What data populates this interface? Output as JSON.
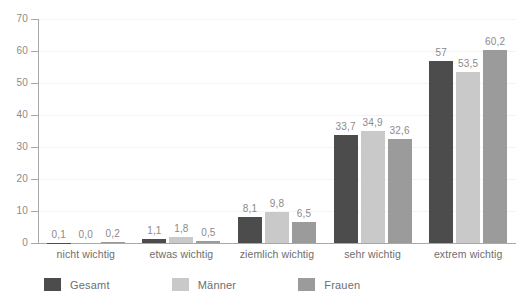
{
  "chart_data": {
    "type": "bar",
    "title": "",
    "subtitle": "",
    "xlabel": "",
    "ylabel": "",
    "ylim": [
      0,
      70
    ],
    "yticks": [
      0,
      10,
      20,
      30,
      40,
      50,
      60,
      70
    ],
    "ytick_labels": [
      "0",
      "10",
      "20",
      "30",
      "40",
      "50",
      "60",
      "70"
    ],
    "grid": true,
    "legend_position": "bottom-left",
    "categories": [
      "nicht wichtig",
      "etwas wichtig",
      "ziemlich wichtig",
      "sehr wichtig",
      "extrem wichtig"
    ],
    "series": [
      {
        "name": "Gesamt",
        "color": "#4c4c4c",
        "values": [
          0.1,
          1.1,
          8.1,
          33.7,
          57
        ],
        "labels": [
          "0,1",
          "1,1",
          "8,1",
          "33,7",
          "57"
        ]
      },
      {
        "name": "Männer",
        "color": "#c9c9c9",
        "values": [
          0.0,
          1.8,
          9.8,
          34.9,
          53.5
        ],
        "labels": [
          "0,0",
          "1,8",
          "9,8",
          "34,9",
          "53,5"
        ]
      },
      {
        "name": "Frauen",
        "color": "#9b9b9b",
        "values": [
          0.2,
          0.5,
          6.5,
          32.6,
          60.2
        ],
        "labels": [
          "0,2",
          "0,5",
          "6,5",
          "32,6",
          "60,2"
        ]
      }
    ]
  },
  "colors": {
    "background": "#ffffff",
    "axis": "#a8a8a8",
    "gridline": "#f4f4f4",
    "text": "#6e6e6e",
    "value_text": "#8a8a8a"
  }
}
